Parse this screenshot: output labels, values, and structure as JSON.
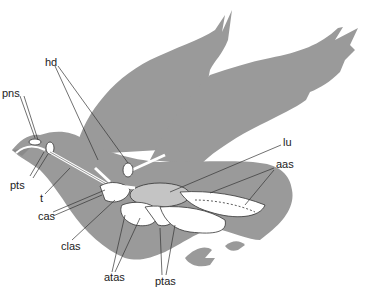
{
  "figure": {
    "colors": {
      "silhouette": "#9a9a9a",
      "organ_fill": "#ffffff",
      "lung_fill": "#c4c4c4",
      "line": "#333333"
    }
  },
  "labels": [
    {
      "id": "pns",
      "text": "pns",
      "x": 2,
      "y": 88
    },
    {
      "id": "pts",
      "text": "pts",
      "x": 10,
      "y": 180
    },
    {
      "id": "t",
      "text": "t",
      "x": 40,
      "y": 196
    },
    {
      "id": "cas",
      "text": "cas",
      "x": 38,
      "y": 214
    },
    {
      "id": "clas",
      "text": "clas",
      "x": 61,
      "y": 244
    },
    {
      "id": "hd",
      "text": "hd",
      "x": 45,
      "y": 60
    },
    {
      "id": "lu",
      "text": "lu",
      "x": 283,
      "y": 140
    },
    {
      "id": "aas",
      "text": "aas",
      "x": 276,
      "y": 162
    },
    {
      "id": "atas",
      "text": "atas",
      "x": 104,
      "y": 275
    },
    {
      "id": "ptas",
      "text": "ptas",
      "x": 155,
      "y": 279
    }
  ]
}
